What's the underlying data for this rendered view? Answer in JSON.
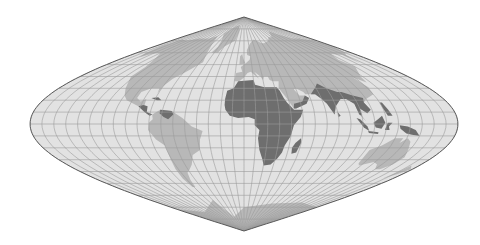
{
  "map": {
    "title": "Sinusoidal projection world map",
    "projection": "sinusoidal",
    "graticule_step_degrees": 10,
    "highlighted_regions": [
      "Africa",
      "Arabian Peninsula (Yemen/Oman)",
      "South Asia",
      "Southeast Asia",
      "Maritime Southeast Asia",
      "Madagascar",
      "Central America (parts)",
      "Caribbean (parts)"
    ],
    "base_land_regions": [
      "North America",
      "South America",
      "Greenland",
      "Europe",
      "Asia",
      "Australia",
      "Antarctica"
    ],
    "colors": {
      "background": "#ffffff",
      "ocean": "#e2e2e2",
      "graticule": "#9c9c9c",
      "land": "#b8b8b8",
      "highlight": "#6e6e6e",
      "outline": "#5a5a5a"
    }
  }
}
